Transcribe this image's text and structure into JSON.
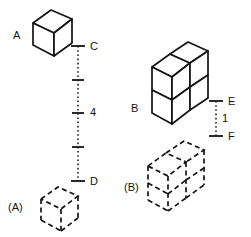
{
  "figure": {
    "title_visible": false,
    "background_color": "#ffffff",
    "stroke_color": "#141414",
    "labels": {
      "cube_a": "A",
      "cube_a_shadow": "(A)",
      "block_b": "B",
      "block_b_shadow": "(B)",
      "point_c": "C",
      "point_d": "D",
      "point_e": "E",
      "point_f": "F",
      "distance_cd": "4",
      "distance_ef": "1"
    }
  },
  "scales": {
    "left": {
      "top_label": "C",
      "bottom_label": "D",
      "value_label": "4",
      "tick_count": 5,
      "style": "dotted"
    },
    "right": {
      "top_label": "E",
      "bottom_label": "F",
      "value_label": "1",
      "tick_count": 2,
      "style": "dotted"
    }
  },
  "objects": [
    {
      "name": "cube-a",
      "label": "A",
      "style": "solid",
      "units": 1,
      "description": "single cube"
    },
    {
      "name": "cube-a-shadow",
      "label": "(A)",
      "style": "dashed",
      "units": 1,
      "description": "single cube outline"
    },
    {
      "name": "block-b",
      "label": "B",
      "style": "solid",
      "units": 4,
      "description": "two-by-two stacked block"
    },
    {
      "name": "block-b-shadow",
      "label": "(B)",
      "style": "dashed",
      "units": 4,
      "description": "two-by-two stacked block outline"
    }
  ]
}
